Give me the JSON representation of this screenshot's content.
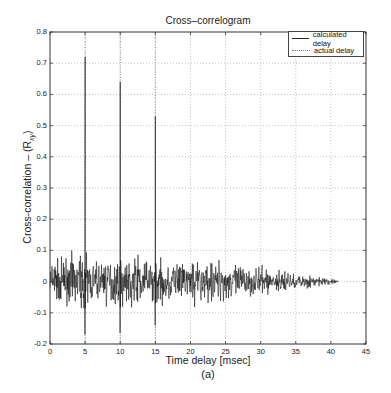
{
  "figure": {
    "title": "Cross–correlogram",
    "xlabel": "Time delay [msec]",
    "ylabel": "Cross-correlation – (R",
    "ylabel_sub": "xy",
    "ylabel_close": ")",
    "caption": "(a)"
  },
  "legend": {
    "items": [
      {
        "label": "calculated delay",
        "style": "solid",
        "color": "#222222"
      },
      {
        "label": "actual delay",
        "style": "dotted",
        "color": "#777777"
      }
    ]
  },
  "chart_data": {
    "type": "line",
    "title": "Cross–correlogram",
    "xlabel": "Time delay [msec]",
    "ylabel": "Cross-correlation – (R_xy)",
    "xlim": [
      0,
      45
    ],
    "ylim": [
      -0.2,
      0.8
    ],
    "xticks": [
      0,
      5,
      10,
      15,
      20,
      25,
      30,
      35,
      40,
      45
    ],
    "yticks": [
      -0.2,
      -0.1,
      0,
      0.1,
      0.2,
      0.3,
      0.4,
      0.5,
      0.6,
      0.7,
      0.8
    ],
    "grid": true,
    "legend_position": "upper right",
    "series": [
      {
        "name": "calculated delay",
        "style": "solid",
        "description": "noisy cross-correlation around 0, amplitude ~±0.08 tapering to 0 at ~41 msec, with sharp peaks at 5, 10, 15 msec",
        "peaks": [
          {
            "x": 5,
            "y": 0.72,
            "neg": -0.17
          },
          {
            "x": 10,
            "y": 0.64,
            "neg": -0.165
          },
          {
            "x": 15,
            "y": 0.53,
            "neg": -0.14
          }
        ],
        "noise": {
          "x_start": 0,
          "x_end": 41,
          "amplitude": 0.075,
          "n_points": 900,
          "seed": 7
        }
      },
      {
        "name": "actual delay",
        "style": "dotted",
        "x": [
          5,
          10,
          15
        ]
      }
    ]
  }
}
